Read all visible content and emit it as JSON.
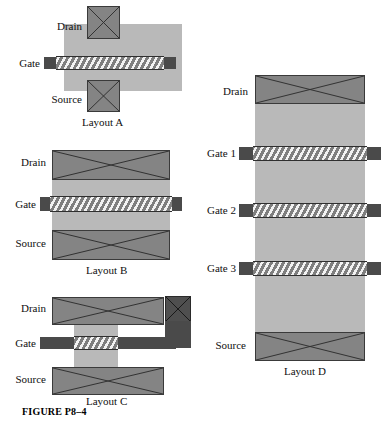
{
  "figure": {
    "caption": "FIGURE P8–4"
  },
  "layouts": [
    {
      "id": "layout-a",
      "caption": "Layout A",
      "labels": {
        "drain": "Drain",
        "gate": "Gate",
        "source": "Source"
      }
    },
    {
      "id": "layout-b",
      "caption": "Layout B",
      "labels": {
        "drain": "Drain",
        "gate": "Gate",
        "source": "Source"
      }
    },
    {
      "id": "layout-c",
      "caption": "Layout C",
      "labels": {
        "drain": "Drain",
        "gate": "Gate",
        "source": "Source"
      }
    },
    {
      "id": "layout-d",
      "caption": "Layout D",
      "labels": {
        "drain": "Drain",
        "gate1": "Gate 1",
        "gate2": "Gate 2",
        "gate3": "Gate 3",
        "source": "Source"
      }
    }
  ],
  "colors": {
    "body_region": "#b9b9b9",
    "contact_pad": "#848484",
    "contact_pad_dark": "#4f4f4f",
    "gate_cap": "#4a4a4a",
    "gate_hatch_light": "#f2f2f2",
    "gate_hatch_dark": "#7e7e7e",
    "outline": "#2e2e2e",
    "background": "#ffffff",
    "text": "#101010"
  }
}
